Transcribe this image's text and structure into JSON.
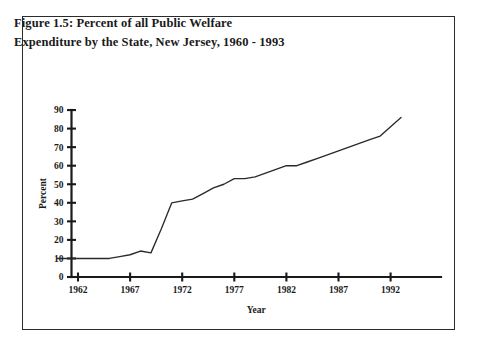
{
  "figure": {
    "title_line1": "Figure 1.5: Percent of all Public Welfare",
    "title_line2": "Expenditure by  the State, New Jersey, 1960 - 1993",
    "border_color": "#2b2b2b",
    "background": "#ffffff"
  },
  "chart_data": {
    "type": "line",
    "title": "Figure 1.5: Percent of all Public Welfare Expenditure by  the State, New Jersey, 1960 - 1993",
    "xlabel": "Year",
    "ylabel": "Percent",
    "xlim": [
      1960,
      1993
    ],
    "ylim": [
      0,
      90
    ],
    "xticks": [
      1962,
      1967,
      1972,
      1977,
      1982,
      1987,
      1992
    ],
    "xtick_labels": [
      "1962",
      "1967",
      "1972",
      "1977",
      "1982",
      "1987",
      "1992"
    ],
    "yticks": [
      0,
      10,
      20,
      30,
      40,
      50,
      60,
      70,
      80,
      90
    ],
    "ytick_labels": [
      "0",
      "10",
      "20",
      "30",
      "40",
      "50",
      "60",
      "70",
      "80",
      "90"
    ],
    "grid": false,
    "legend": false,
    "line_color": "#2a2a2a",
    "series": [
      {
        "name": "Percent of all Public Welfare Expenditure by the State",
        "x": [
          1960,
          1961,
          1962,
          1963,
          1964,
          1965,
          1966,
          1967,
          1968,
          1969,
          1970,
          1971,
          1972,
          1973,
          1974,
          1975,
          1976,
          1977,
          1978,
          1979,
          1980,
          1981,
          1982,
          1983,
          1984,
          1985,
          1986,
          1987,
          1988,
          1989,
          1990,
          1991,
          1992,
          1993
        ],
        "values": [
          10,
          10,
          10,
          10,
          10,
          10,
          11,
          12,
          14,
          13,
          26,
          40,
          41,
          42,
          45,
          48,
          50,
          53,
          53,
          54,
          56,
          58,
          60,
          60,
          62,
          64,
          66,
          68,
          70,
          72,
          74,
          76,
          81,
          86
        ]
      }
    ]
  }
}
